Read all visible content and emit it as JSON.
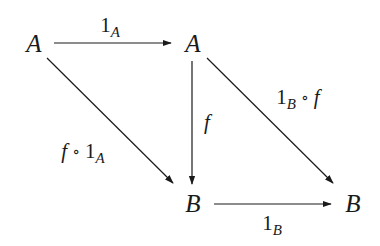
{
  "diagram": {
    "type": "commutative-diagram",
    "nodes": {
      "top_left": {
        "label": "A"
      },
      "top_right": {
        "label": "A"
      },
      "bottom_middle": {
        "label": "B"
      },
      "bottom_right": {
        "label": "B"
      }
    },
    "arrows": {
      "top": {
        "from": "top_left",
        "to": "top_right",
        "label": {
          "base": "1",
          "sub": "A"
        }
      },
      "vertical": {
        "from": "top_right",
        "to": "bottom_middle",
        "label": {
          "base": "f"
        }
      },
      "left_diagonal": {
        "from": "top_left",
        "to": "bottom_middle",
        "label": {
          "base": "f",
          "op": "∘",
          "tail": "1",
          "sub": "A"
        }
      },
      "right_diagonal": {
        "from": "top_right",
        "to": "bottom_right",
        "label": {
          "base": "1",
          "sub": "B",
          "op": "∘",
          "tail": "f"
        }
      },
      "bottom": {
        "from": "bottom_middle",
        "to": "bottom_right",
        "label": {
          "base": "1",
          "sub": "B"
        }
      }
    },
    "colors": {
      "ink": "#1a1a1a",
      "background": "#ffffff"
    }
  }
}
